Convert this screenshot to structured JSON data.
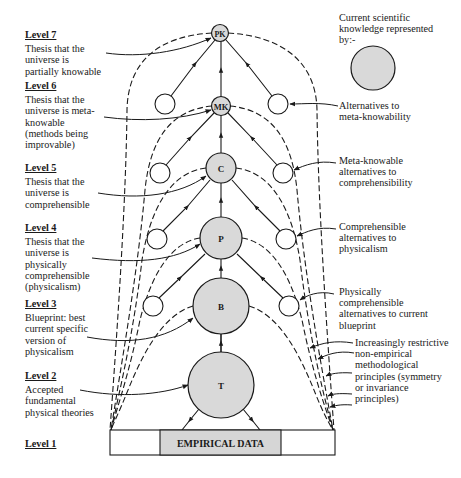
{
  "levels": [
    {
      "id": "level7",
      "label": "Level 7",
      "description": "Thesis that the universe is partially knowable"
    },
    {
      "id": "level6",
      "label": "Level 6",
      "description": "Thesis that the universe is meta-knowable (methods being improvable)"
    },
    {
      "id": "level5",
      "label": "Level 5",
      "description": "Thesis that the universe is comprehensible"
    },
    {
      "id": "level4",
      "label": "Level 4",
      "description": "Thesis that the universe is physically comprehensible (physicalism)"
    },
    {
      "id": "level3",
      "label": "Level 3",
      "description": "Blueprint: best current specific version of physicalism"
    },
    {
      "id": "level2",
      "label": "Level 2",
      "description": "Accepted fundamental physical theories"
    },
    {
      "id": "level1",
      "label": "Level 1",
      "description": ""
    }
  ],
  "nodes": [
    {
      "id": "PK",
      "label": "PK"
    },
    {
      "id": "MK",
      "label": "MK"
    },
    {
      "id": "C",
      "label": "C"
    },
    {
      "id": "P",
      "label": "P"
    },
    {
      "id": "B",
      "label": "B"
    },
    {
      "id": "T",
      "label": "T"
    }
  ],
  "base": {
    "label": "EMPIRICAL DATA"
  },
  "legend": {
    "text": "Current scientific knowledge represented by:-"
  },
  "annotations": {
    "alt_meta_knowability": "Alternatives to meta-knowability",
    "meta_knowable_alts": "Meta-knowable alternatives to comprehensibility",
    "comprehensible_alts": "Comprehensible alternatives to physicalism",
    "physically_comprehensible_alts": "Physically comprehensible alternatives to current blueprint",
    "principles": "Increasingly restrictive non-empirical methodological principles (symmetry or invariance principles)"
  },
  "colors": {
    "node_fill": "#d9d9d9",
    "stroke": "#1a1a1a",
    "base_fill": "#d6d6d6"
  }
}
